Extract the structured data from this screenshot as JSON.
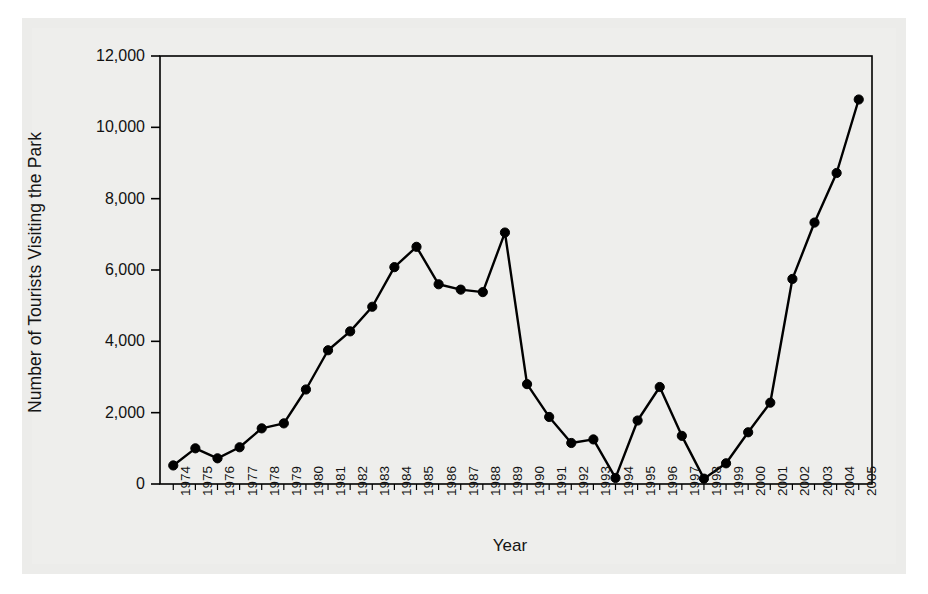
{
  "chart_data": {
    "type": "line",
    "title": "",
    "xlabel": "Year",
    "ylabel": "Number of Tourists Visiting the Park",
    "xlim": [
      1973.4,
      2005.6
    ],
    "ylim": [
      0,
      12000
    ],
    "grid": false,
    "legend": null,
    "y_ticks": [
      0,
      2000,
      4000,
      6000,
      8000,
      10000,
      12000
    ],
    "y_tick_labels": [
      "0",
      "2,000",
      "4,000",
      "6,000",
      "8,000",
      "10,000",
      "12,000"
    ],
    "x_tick_labels": [
      "1974",
      "1975",
      "1976",
      "1977",
      "1978",
      "1979",
      "1980",
      "1981",
      "1982",
      "1983",
      "1984",
      "1985",
      "1986",
      "1987",
      "1988",
      "1989",
      "1990",
      "1991",
      "1992",
      "1993",
      "1994",
      "1995",
      "1996",
      "1997",
      "1998",
      "1999",
      "2000",
      "2001",
      "2002",
      "2003",
      "2004",
      "2005"
    ],
    "marker": "filled-circle",
    "line_color": "#000000",
    "marker_color": "#000000",
    "series": [
      {
        "name": "Number of Tourists Visiting the Park",
        "x": [
          1974,
          1975,
          1976,
          1977,
          1978,
          1979,
          1980,
          1981,
          1982,
          1983,
          1984,
          1985,
          1986,
          1987,
          1988,
          1989,
          1990,
          1991,
          1992,
          1993,
          1994,
          1995,
          1996,
          1997,
          1998,
          1999,
          2000,
          2001,
          2002,
          2003,
          2004,
          2005
        ],
        "values": [
          520,
          1000,
          720,
          1030,
          1560,
          1700,
          2650,
          3750,
          4280,
          4970,
          6080,
          6650,
          5600,
          5450,
          5380,
          7050,
          2800,
          1880,
          1150,
          1250,
          170,
          1780,
          2720,
          1350,
          150,
          580,
          1450,
          2280,
          5750,
          7330,
          8720,
          10780
        ]
      }
    ]
  },
  "figure": {
    "background_color": "#ffffff",
    "panel_color": "#eeeeec",
    "axis_color": "#000000"
  }
}
